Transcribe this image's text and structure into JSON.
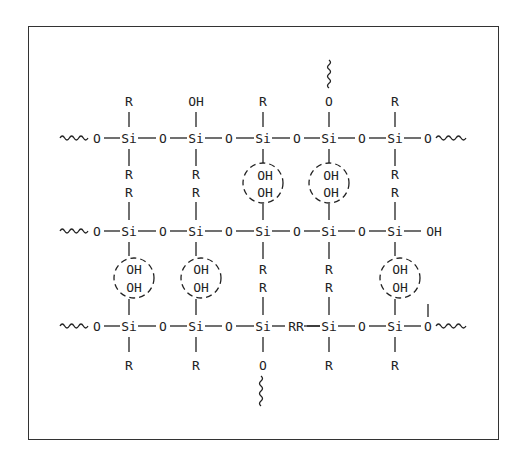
{
  "figure": {
    "colors": {
      "ink": "#222222",
      "frame": "#333333",
      "background": "#ffffff"
    }
  },
  "labels": {
    "si": "Si",
    "o": "O",
    "r": "R",
    "oh": "OH",
    "rr": "RR"
  },
  "rows": [
    {
      "id": "top",
      "chain": [
        "~",
        "O",
        "Si",
        "O",
        "Si",
        "O",
        "Si",
        "O",
        "Si",
        "O",
        "Si",
        "O",
        "~"
      ],
      "above": [
        "R",
        "OH",
        "R",
        "O (~)",
        "R"
      ],
      "below": [
        "R",
        "R",
        "OH",
        "OH",
        "R"
      ]
    },
    {
      "id": "middle",
      "chain": [
        "~",
        "O",
        "Si",
        "O",
        "Si",
        "O",
        "Si",
        "O",
        "Si",
        "O",
        "Si",
        "OH"
      ],
      "above": [
        "R",
        "R",
        "OH",
        "OH",
        "R"
      ],
      "below": [
        "OH",
        "OH",
        "R",
        "R",
        "OH"
      ]
    },
    {
      "id": "bottom",
      "chain": [
        "~",
        "O",
        "Si",
        "O",
        "Si",
        "O",
        "Si",
        "RR",
        "Si",
        "O",
        "Si",
        "O",
        "~"
      ],
      "above": [
        "OH",
        "OH",
        "R",
        "R",
        "OH"
      ],
      "below": [
        "R",
        "R",
        "O (~)",
        "R",
        "R"
      ]
    }
  ],
  "hbond_circles": [
    {
      "between": "top-middle",
      "column": 3,
      "text": [
        "OH",
        "OH"
      ]
    },
    {
      "between": "top-middle",
      "column": 4,
      "text": [
        "OH",
        "OH"
      ]
    },
    {
      "between": "middle-bottom",
      "column": 1,
      "text": [
        "OH",
        "OH"
      ]
    },
    {
      "between": "middle-bottom",
      "column": 2,
      "text": [
        "OH",
        "OH"
      ]
    },
    {
      "between": "middle-bottom",
      "column": 5,
      "text": [
        "OH",
        "OH"
      ]
    }
  ]
}
